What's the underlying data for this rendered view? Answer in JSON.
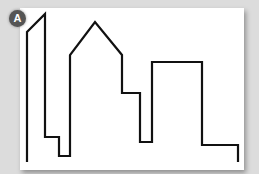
{
  "figure": {
    "badge_label": "A",
    "stroke_color": "#111111",
    "background_color": "#ffffff",
    "points": "27,162 27,32 45,14 45,137 59,137 59,156 70,156 70,55 95,22 122,55 122,93 140,93 140,142 152,142 152,62 202,62 202,145 238,145 238,162"
  }
}
